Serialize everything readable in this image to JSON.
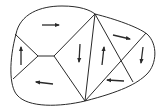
{
  "diagram": {
    "type": "planar-partition-with-flow-arrows",
    "stroke_color": "#2a2a2a",
    "background": "#ffffff",
    "outline_path": "M 16 34 C 20 14, 40 6, 62 6 C 80 6, 90 10, 95 14 C 115 19, 138 27, 147 34 C 158 44, 157 64, 147 74 C 137 84, 120 92, 85 101 C 60 107, 28 108, 17 95 C 9 86, 9 60, 16 34 Z",
    "vertices": {
      "top": [
        95,
        14
      ],
      "bottom": [
        85,
        101
      ],
      "left_top": [
        15,
        34
      ],
      "left_bottom": [
        13,
        79
      ],
      "hub_left": [
        38,
        56
      ],
      "hub_right": [
        54,
        56
      ],
      "right_top": [
        146,
        33
      ],
      "right_bottom": [
        133,
        82
      ],
      "cross": [
        121,
        59
      ]
    },
    "edges": [
      {
        "name": "left-upper-spoke",
        "from": [
          15,
          34
        ],
        "to": [
          38,
          56
        ]
      },
      {
        "name": "left-lower-spoke",
        "from": [
          13,
          79
        ],
        "to": [
          38,
          56
        ]
      },
      {
        "name": "hub-bar",
        "from": [
          38,
          56
        ],
        "to": [
          54,
          56
        ]
      },
      {
        "name": "hub-to-top",
        "from": [
          54,
          56
        ],
        "to": [
          95,
          14
        ]
      },
      {
        "name": "hub-to-bottom",
        "from": [
          54,
          56
        ],
        "to": [
          85,
          101
        ]
      },
      {
        "name": "center-divider",
        "from": [
          95,
          14
        ],
        "to": [
          85,
          101
        ]
      },
      {
        "name": "top-to-right-bottom",
        "from": [
          95,
          14
        ],
        "to": [
          133,
          82
        ]
      },
      {
        "name": "right-top-to-bottom",
        "from": [
          146,
          33
        ],
        "to": [
          85,
          101
        ]
      }
    ],
    "arrows": [
      {
        "region": "top-left",
        "direction": "right",
        "from": [
          42,
          25
        ],
        "to": [
          59,
          25
        ]
      },
      {
        "region": "left",
        "direction": "up",
        "from": [
          21,
          65
        ],
        "to": [
          21,
          47
        ]
      },
      {
        "region": "bottom-left",
        "direction": "left",
        "from": [
          53,
          84
        ],
        "to": [
          36,
          82
        ]
      },
      {
        "region": "center-left-triangle",
        "direction": "down",
        "from": [
          80,
          44
        ],
        "to": [
          79,
          62
        ]
      },
      {
        "region": "center-right-triangle",
        "direction": "up",
        "from": [
          102,
          65
        ],
        "to": [
          104,
          47
        ]
      },
      {
        "region": "top-right",
        "direction": "right",
        "from": [
          113,
          35
        ],
        "to": [
          130,
          39
        ]
      },
      {
        "region": "far-right",
        "direction": "down",
        "from": [
          143,
          47
        ],
        "to": [
          141,
          63
        ]
      },
      {
        "region": "bottom-right",
        "direction": "left",
        "from": [
          124,
          81
        ],
        "to": [
          107,
          80
        ]
      }
    ]
  }
}
